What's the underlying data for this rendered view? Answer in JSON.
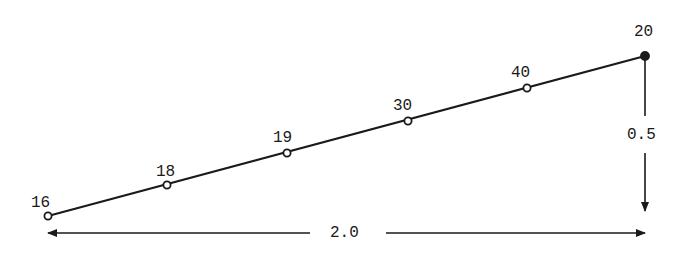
{
  "diagram": {
    "type": "sloped-line-with-labeled-points",
    "colors": {
      "stroke": "#1a1a1a",
      "background": "#ffffff"
    },
    "points": [
      {
        "label": "16",
        "x": 48,
        "y": 216,
        "marker": "open-circle"
      },
      {
        "label": "18",
        "x": 167,
        "y": 185,
        "marker": "open-circle"
      },
      {
        "label": "19",
        "x": 287,
        "y": 153,
        "marker": "open-circle"
      },
      {
        "label": "30",
        "x": 408,
        "y": 121,
        "marker": "open-circle"
      },
      {
        "label": "40",
        "x": 527,
        "y": 88,
        "marker": "open-circle"
      },
      {
        "label": "20",
        "x": 645,
        "y": 56,
        "marker": "filled-circle"
      }
    ],
    "dimensions": {
      "horizontal": {
        "label": "2.0",
        "x1": 48,
        "x2": 645,
        "y": 233
      },
      "vertical": {
        "label": "0.5",
        "x": 645,
        "y1": 56,
        "y2": 210
      }
    }
  }
}
